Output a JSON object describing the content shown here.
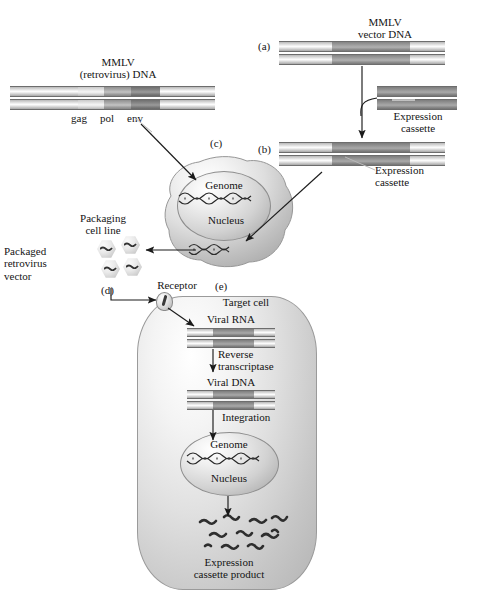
{
  "figure": {
    "background_color": "#ffffff",
    "ink_color": "#141414"
  },
  "panels": {
    "a": "(a)",
    "b": "(b)",
    "c": "(c)",
    "d": "(d)",
    "e": "(e)"
  },
  "labels": {
    "mmlv_retrovirus_dna": "MMLV\n(retrovirus) DNA",
    "mmlv_vector_dna": "MMLV\nvector DNA",
    "gag": "gag",
    "pol": "pol",
    "env": "env",
    "expression_cassette_right": "Expression\ncassette",
    "expression_cassette_b": "Expression\ncassette",
    "genome_packaging": "Genome",
    "nucleus_packaging": "Nucleus",
    "packaging_cell_line": "Packaging\ncell line",
    "packaged_retrovirus_vector": "Packaged\nretrovirus\nvector",
    "receptor": "Receptor",
    "target_cell": "Target cell",
    "viral_rna": "Viral RNA",
    "reverse_transcriptase": "Reverse\ntranscriptase",
    "viral_dna": "Viral DNA",
    "integration": "Integration",
    "genome_target": "Genome",
    "nucleus_target": "Nucleus",
    "expression_cassette_product": "Expression\ncassette product"
  },
  "dna_constructs": {
    "retrovirus_dna": {
      "name": "MMLV (retrovirus) DNA",
      "segments": [
        "LTR",
        "gag",
        "pol",
        "env",
        "LTR"
      ]
    },
    "vector_dna": {
      "name": "MMLV vector DNA",
      "segments": [
        "LTR",
        "backbone",
        "LTR"
      ]
    },
    "expression_cassette": {
      "name": "Expression cassette",
      "segments": [
        "cassette"
      ]
    },
    "recombinant_vector": {
      "name": "MMLV vector DNA with expression cassette",
      "segments": [
        "LTR",
        "expression cassette",
        "LTR"
      ]
    },
    "viral_rna": {
      "name": "Viral RNA",
      "segments": [
        "LTR",
        "expression cassette",
        "LTR"
      ]
    },
    "viral_dna_target": {
      "name": "Viral DNA",
      "segments": [
        "LTR",
        "expression cassette",
        "LTR"
      ]
    }
  },
  "counts": {
    "packaged_virions": 4,
    "product_squiggles": 11
  },
  "colors": {
    "ltr_band": "#e6e6e6",
    "gag_band": "#dcdcdc",
    "pol_band": "#a8a8a8",
    "env_band": "#808080",
    "cassette_band": "#999999",
    "cell_fill": "#dcdcdc",
    "nucleus_fill": "#cfcfcf",
    "arrow": "#1b1b1b"
  }
}
